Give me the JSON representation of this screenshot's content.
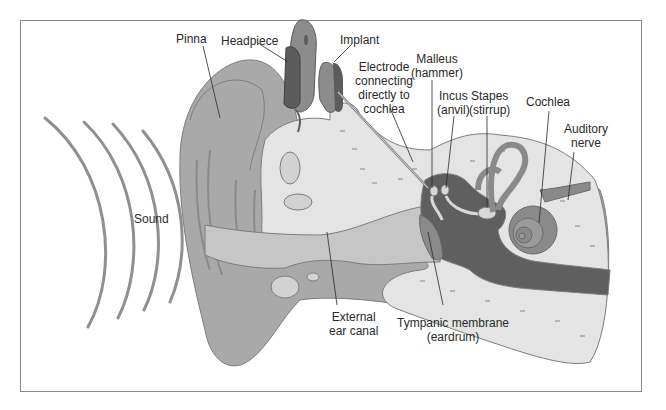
{
  "diagram": {
    "colors": {
      "frame": "#8a8a8a",
      "outer_ear": "#a9a9a9",
      "outer_ear_dark": "#8e8e8e",
      "bone": "#e4e4e4",
      "canal": "#c6c6c6",
      "middle_ear": "#5f5f5f",
      "inner_ear": "#8a8a8a",
      "device_dark": "#5c5c5c",
      "device_mid": "#8c8c8c",
      "leader_line": "#2a2a2a",
      "text": "#2a2a2a"
    },
    "labels": {
      "pinna": "Pinna",
      "headpiece": "Headpiece",
      "implant": "Implant",
      "electrode": [
        "Electrode",
        "connecting",
        "directly to",
        "cochlea"
      ],
      "malleus": [
        "Malleus",
        "(hammer)"
      ],
      "incus": [
        "Incus",
        "(anvil)"
      ],
      "stapes": [
        "Stapes",
        "(stirrup)"
      ],
      "cochlea": "Cochlea",
      "auditory_nerve": [
        "Auditory",
        "nerve"
      ],
      "sound": "Sound",
      "external_ear_canal": [
        "External",
        "ear canal"
      ],
      "tympanic_membrane": [
        "Tympanic membrane",
        "(eardrum)"
      ]
    }
  }
}
